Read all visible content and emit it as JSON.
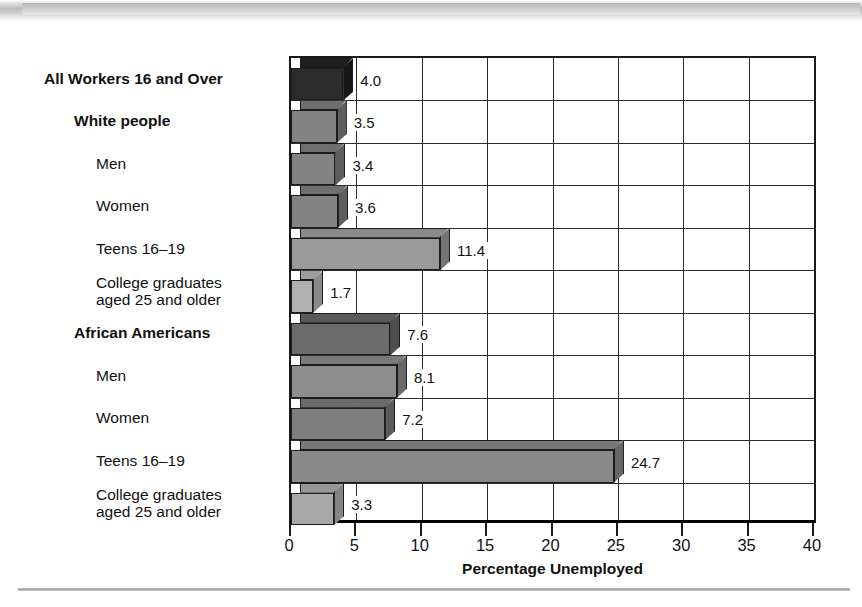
{
  "figure": {
    "xlabel": "Percentage Unemployed"
  },
  "axis": {
    "ticks": [
      "0",
      "5",
      "10",
      "15",
      "20",
      "25",
      "30",
      "35",
      "40"
    ]
  },
  "chart_data": {
    "type": "bar",
    "orientation": "horizontal",
    "title": "",
    "subtitle": "",
    "xlabel": "Percentage Unemployed",
    "ylabel": "",
    "xlim": [
      0,
      40
    ],
    "xticks": [
      0,
      5,
      10,
      15,
      20,
      25,
      30,
      35,
      40
    ],
    "grid": true,
    "legend": "none",
    "categories": [
      "All Workers 16 and Over",
      "White people",
      "Men",
      "Women",
      "Teens 16–19",
      "College graduates\naged 25 and older",
      "African Americans",
      "Men",
      "Women",
      "Teens 16–19",
      "College graduates\naged 25 and older"
    ],
    "values": [
      4.0,
      3.5,
      3.4,
      3.6,
      11.4,
      1.7,
      7.6,
      8.1,
      7.2,
      24.7,
      3.3
    ],
    "value_labels": [
      "4.0",
      "3.5",
      "3.4",
      "3.6",
      "11.4",
      "1.7",
      "7.6",
      "8.1",
      "7.2",
      "24.7",
      "3.3"
    ],
    "bars": [
      {
        "label": "All Workers 16 and Over",
        "value": 4.0,
        "value_label": "4.0",
        "indent": 0,
        "bold": true,
        "color": "#2b2b2b",
        "top_color": "#1e1e1e",
        "side_color": "#171717"
      },
      {
        "label": "White people",
        "value": 3.5,
        "value_label": "3.5",
        "indent": 1,
        "bold": true,
        "color": "#838383",
        "top_color": "#6f6f6f",
        "side_color": "#5e5e5e"
      },
      {
        "label": "Men",
        "value": 3.4,
        "value_label": "3.4",
        "indent": 2,
        "bold": false,
        "color": "#838383",
        "top_color": "#6f6f6f",
        "side_color": "#5e5e5e"
      },
      {
        "label": "Women",
        "value": 3.6,
        "value_label": "3.6",
        "indent": 2,
        "bold": false,
        "color": "#838383",
        "top_color": "#6f6f6f",
        "side_color": "#5e5e5e"
      },
      {
        "label": "Teens 16–19",
        "value": 11.4,
        "value_label": "11.4",
        "indent": 2,
        "bold": false,
        "color": "#9a9a9a",
        "top_color": "#8a8a8a",
        "side_color": "#747474"
      },
      {
        "label": "College graduates\naged 25 and older",
        "value": 1.7,
        "value_label": "1.7",
        "indent": 2,
        "bold": false,
        "color": "#b0b0b0",
        "top_color": "#9d9d9d",
        "side_color": "#8a8a8a"
      },
      {
        "label": "African Americans",
        "value": 7.6,
        "value_label": "7.6",
        "indent": 1,
        "bold": true,
        "color": "#6b6b6b",
        "top_color": "#5a5a5a",
        "side_color": "#4d4d4d"
      },
      {
        "label": "Men",
        "value": 8.1,
        "value_label": "8.1",
        "indent": 2,
        "bold": false,
        "color": "#8d8d8d",
        "top_color": "#7a7a7a",
        "side_color": "#696969"
      },
      {
        "label": "Women",
        "value": 7.2,
        "value_label": "7.2",
        "indent": 2,
        "bold": false,
        "color": "#7d7d7d",
        "top_color": "#6b6b6b",
        "side_color": "#5a5a5a"
      },
      {
        "label": "Teens 16–19",
        "value": 24.7,
        "value_label": "24.7",
        "indent": 2,
        "bold": false,
        "color": "#8a8a8a",
        "top_color": "#787878",
        "side_color": "#666666"
      },
      {
        "label": "College graduates\naged 25 and older",
        "value": 3.3,
        "value_label": "3.3",
        "indent": 2,
        "bold": false,
        "color": "#a9a9a9",
        "top_color": "#979797",
        "side_color": "#858585"
      }
    ]
  }
}
